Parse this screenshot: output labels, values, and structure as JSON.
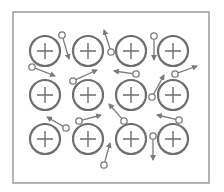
{
  "diagram": {
    "colors": {
      "frame": "#9a9a9a",
      "ion": "#6e6e6e",
      "electron": "#7a7a7a",
      "background": "#ffffff"
    },
    "frame": {
      "x": 13,
      "y": 12,
      "width": 196,
      "height": 171
    },
    "ion_radius": 15,
    "ion_symbol": "+",
    "ions": [
      {
        "id": "ion-r1c1",
        "cx": 45,
        "cy": 51
      },
      {
        "id": "ion-r1c2",
        "cx": 88,
        "cy": 51
      },
      {
        "id": "ion-r1c3",
        "cx": 131,
        "cy": 51
      },
      {
        "id": "ion-r1c4",
        "cx": 173,
        "cy": 51
      },
      {
        "id": "ion-r2c1",
        "cx": 45,
        "cy": 95
      },
      {
        "id": "ion-r2c2",
        "cx": 88,
        "cy": 95
      },
      {
        "id": "ion-r2c3",
        "cx": 131,
        "cy": 95
      },
      {
        "id": "ion-r2c4",
        "cx": 173,
        "cy": 95
      },
      {
        "id": "ion-r3c1",
        "cx": 45,
        "cy": 139
      },
      {
        "id": "ion-r3c2",
        "cx": 88,
        "cy": 139
      },
      {
        "id": "ion-r3c3",
        "cx": 131,
        "cy": 139
      },
      {
        "id": "ion-r3c4",
        "cx": 173,
        "cy": 139
      }
    ],
    "electrons": [
      {
        "id": "e1",
        "x": 62,
        "y": 35,
        "ax": 69,
        "ay": 59
      },
      {
        "id": "e2",
        "x": 111,
        "y": 52,
        "ax": 104,
        "ay": 30
      },
      {
        "id": "e3",
        "x": 154,
        "y": 36,
        "ax": 154,
        "ay": 60
      },
      {
        "id": "e4",
        "x": 32,
        "y": 67,
        "ax": 55,
        "ay": 76
      },
      {
        "id": "e5",
        "x": 73,
        "y": 81,
        "ax": 97,
        "ay": 70
      },
      {
        "id": "e6",
        "x": 136,
        "y": 74,
        "ax": 114,
        "ay": 71
      },
      {
        "id": "e7",
        "x": 152,
        "y": 97,
        "ax": 164,
        "ay": 75
      },
      {
        "id": "e8",
        "x": 175,
        "y": 74,
        "ax": 197,
        "ay": 66
      },
      {
        "id": "e9",
        "x": 66,
        "y": 128,
        "ax": 47,
        "ay": 117
      },
      {
        "id": "e10",
        "x": 79,
        "y": 121,
        "ax": 101,
        "ay": 115
      },
      {
        "id": "e11",
        "x": 124,
        "y": 121,
        "ax": 109,
        "ay": 104
      },
      {
        "id": "e12",
        "x": 179,
        "y": 120,
        "ax": 157,
        "ay": 115
      },
      {
        "id": "e13",
        "x": 104,
        "y": 165,
        "ax": 110,
        "ay": 143
      },
      {
        "id": "e14",
        "x": 153,
        "y": 136,
        "ax": 153,
        "ay": 160
      }
    ]
  }
}
